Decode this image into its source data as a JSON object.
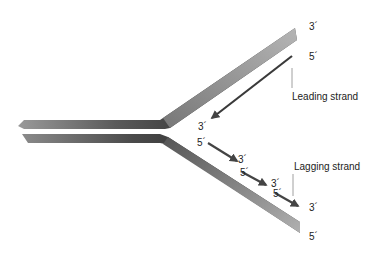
{
  "diagram": {
    "labels": {
      "top_parent_3": "3´",
      "top_parent_5": "5´",
      "leading_3": "3´",
      "leading_strand": "Leading strand",
      "lag1_5": "5´",
      "lag1_3": "3´",
      "lag2_5": "5´",
      "lag2_3": "3´",
      "lag3_5": "5´",
      "lag3_3": "3´",
      "lagging_strand": "Lagging strand",
      "bottom_parent_5": "5´"
    },
    "colors": {
      "parent_strand": "#8c8c8c",
      "parent_dark": "#3a3a3a",
      "new_strand": "#444444",
      "pointer_line": "#888888"
    }
  }
}
